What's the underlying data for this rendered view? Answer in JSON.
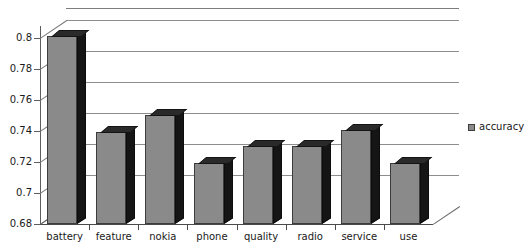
{
  "chart_data": {
    "type": "bar",
    "title": "",
    "subtitle": "",
    "xlabel": "",
    "ylabel": "",
    "categories": [
      "battery",
      "feature",
      "nokia",
      "phone",
      "quality",
      "radio",
      "service",
      "use"
    ],
    "series": [
      {
        "name": "accuracy",
        "values": [
          0.8015,
          0.7395,
          0.7505,
          0.7195,
          0.7305,
          0.7305,
          0.7405,
          0.7195
        ]
      }
    ],
    "ylim": [
      0.68,
      0.808
    ],
    "yticks": [
      0.68,
      0.7,
      0.72,
      0.74,
      0.76,
      0.78,
      0.8
    ],
    "ytick_labels": [
      "0.68",
      "0.7",
      "0.72",
      "0.74",
      "0.76",
      "0.78",
      "0.8"
    ],
    "grid": true,
    "grid_axis": "y",
    "legend": [
      "accuracy"
    ],
    "legend_position": "right",
    "style": "3d-column",
    "colors": {
      "bar_face": "#8a8a8a",
      "bar_side": "#151515",
      "bar_top": "#2a2a2a",
      "bar_outline": "#3d3d3d",
      "gridline": "#8d8d8d",
      "axis": "#4a4a4a",
      "background": "#ffffff",
      "text": "#1a1a1a"
    }
  },
  "legend": {
    "entry_label": "accuracy",
    "swatch_name": "accuracy-swatch"
  }
}
